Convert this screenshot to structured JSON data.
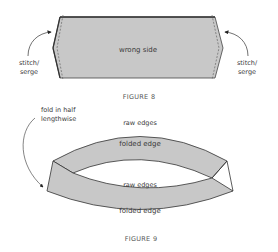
{
  "figure8": {
    "panel_label": "wrong side",
    "left_callout": {
      "line1": "stitch/",
      "line2": "serge"
    },
    "right_callout": {
      "line1": "stitch/",
      "line2": "serge"
    },
    "caption": "FIGURE 8"
  },
  "figure9": {
    "callout": {
      "line1": "fold in half",
      "line2": "lengthwise"
    },
    "top_raw_label": "raw edges",
    "top_fold_label": "folded edge",
    "middle_raw_label": "raw edges",
    "bottom_fold_label": "folded edge",
    "caption": "FIGURE 9"
  },
  "colors": {
    "fabric_fill": "#c8c8c8",
    "outline": "#333333",
    "text": "#3a3a3a"
  }
}
